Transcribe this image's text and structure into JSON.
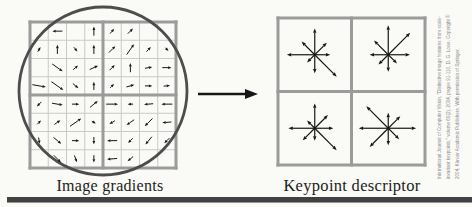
{
  "figure": {
    "left_caption": "Image gradients",
    "right_caption": "Keypoint descriptor",
    "citation_lines": [
      "International Journal of Computer Vision, \"Distinctive image features from scale-",
      "invariant keypoints,\" volume 60(2), 2004, pages 91-110, D. G. Lowe. Copyright ©",
      "2004, Kluwer Academic Publishers. With permission of Springer."
    ]
  },
  "colors": {
    "background": "#fafaf6",
    "grid_thin_line": "#c9c9c9",
    "grid_border": "#9b9b9b",
    "gaussian_circle": "#4d4d4d",
    "arrow": "#161616",
    "caption_text": "#1c1c1c",
    "citation_text": "#8a8a8a",
    "bottom_bar": "#414141"
  },
  "chart_data": {
    "type": "diagram",
    "gradient_grid": {
      "rows": 8,
      "cols": 8,
      "arrow_format": [
        "row",
        "col",
        "angle_deg",
        "length_frac"
      ],
      "arrows": [
        [
          1,
          2,
          180,
          0.55
        ],
        [
          1,
          4,
          90,
          0.5
        ],
        [
          1,
          5,
          50,
          0.35
        ],
        [
          1,
          6,
          45,
          0.4
        ],
        [
          2,
          1,
          60,
          0.3
        ],
        [
          2,
          2,
          90,
          0.5
        ],
        [
          2,
          3,
          -50,
          0.3
        ],
        [
          2,
          4,
          90,
          0.5
        ],
        [
          2,
          5,
          45,
          0.5
        ],
        [
          2,
          6,
          55,
          0.7
        ],
        [
          2,
          7,
          45,
          0.35
        ],
        [
          2,
          8,
          -45,
          0.25
        ],
        [
          3,
          2,
          -35,
          0.7
        ],
        [
          3,
          3,
          40,
          0.35
        ],
        [
          3,
          4,
          25,
          0.5
        ],
        [
          3,
          5,
          45,
          0.4
        ],
        [
          3,
          6,
          90,
          0.5
        ],
        [
          3,
          7,
          10,
          0.4
        ],
        [
          3,
          8,
          0,
          0.5
        ],
        [
          4,
          1,
          -10,
          0.75
        ],
        [
          4,
          2,
          -35,
          0.8
        ],
        [
          4,
          3,
          -40,
          0.4
        ],
        [
          4,
          4,
          90,
          0.45
        ],
        [
          4,
          5,
          45,
          0.3
        ],
        [
          4,
          6,
          15,
          0.45
        ],
        [
          4,
          7,
          0,
          0.4
        ],
        [
          4,
          8,
          5,
          0.35
        ],
        [
          5,
          1,
          -135,
          0.35
        ],
        [
          5,
          2,
          -10,
          0.6
        ],
        [
          5,
          3,
          0,
          0.4
        ],
        [
          5,
          4,
          40,
          0.55
        ],
        [
          5,
          5,
          0,
          0.65
        ],
        [
          5,
          6,
          180,
          0.3
        ],
        [
          5,
          7,
          185,
          0.5
        ],
        [
          5,
          8,
          180,
          0.6
        ],
        [
          6,
          1,
          45,
          0.3
        ],
        [
          6,
          2,
          35,
          0.4
        ],
        [
          6,
          3,
          35,
          0.75
        ],
        [
          6,
          4,
          -30,
          0.25
        ],
        [
          6,
          5,
          210,
          0.35
        ],
        [
          6,
          6,
          215,
          0.5
        ],
        [
          6,
          7,
          225,
          0.6
        ],
        [
          6,
          8,
          185,
          0.5
        ],
        [
          7,
          1,
          -80,
          0.35
        ],
        [
          7,
          2,
          -40,
          0.55
        ],
        [
          7,
          3,
          0,
          0.4
        ],
        [
          7,
          4,
          -90,
          0.4
        ],
        [
          7,
          5,
          180,
          0.55
        ],
        [
          7,
          6,
          225,
          0.35
        ],
        [
          7,
          7,
          230,
          0.55
        ],
        [
          7,
          8,
          225,
          0.4
        ],
        [
          8,
          2,
          -45,
          0.55
        ],
        [
          8,
          3,
          -70,
          0.4
        ],
        [
          8,
          4,
          -90,
          0.4
        ],
        [
          8,
          5,
          185,
          0.55
        ],
        [
          8,
          6,
          220,
          0.4
        ]
      ]
    },
    "descriptor": {
      "rows": 2,
      "cols": 2,
      "bin_angles_deg": [
        0,
        45,
        90,
        135,
        180,
        225,
        270,
        315
      ],
      "cells": [
        {
          "name": "top-left",
          "bin_lengths": [
            0.5,
            0.55,
            0.85,
            0.6,
            0.9,
            0.35,
            0.6,
            1.0
          ]
        },
        {
          "name": "top-right",
          "bin_lengths": [
            0.7,
            1.0,
            0.95,
            0.65,
            0.6,
            0.45,
            0.55,
            0.4
          ]
        },
        {
          "name": "bottom-left",
          "bin_lengths": [
            0.6,
            0.6,
            0.8,
            0.35,
            0.85,
            0.55,
            0.4,
            1.0
          ]
        },
        {
          "name": "bottom-right",
          "bin_lengths": [
            0.9,
            0.55,
            0.5,
            1.0,
            0.95,
            0.85,
            0.55,
            0.5
          ]
        }
      ]
    }
  }
}
